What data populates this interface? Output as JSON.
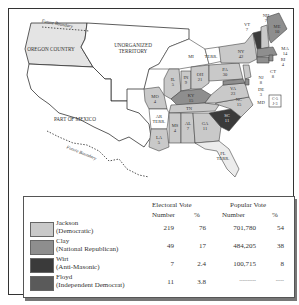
{
  "map": {
    "regions": {
      "oregon": "OREGON COUNTRY",
      "unorganized_1": "UNORGANIZED",
      "unorganized_2": "TERRITORY",
      "mexico": "PART OF MEXICO",
      "future_boundary_north": "Future Boundary",
      "future_boundary_south": "Future Boundary"
    },
    "states": [
      {
        "abbr": "MI",
        "votes": ""
      },
      {
        "abbr": "TERR.",
        "votes": ""
      },
      {
        "abbr": "IL",
        "votes": "5"
      },
      {
        "abbr": "IN",
        "votes": "9"
      },
      {
        "abbr": "OH",
        "votes": "21"
      },
      {
        "abbr": "MO",
        "votes": "4"
      },
      {
        "abbr": "KY",
        "votes": "15"
      },
      {
        "abbr": "TN",
        "votes": "15"
      },
      {
        "abbr": "AR",
        "votes": "TERR."
      },
      {
        "abbr": "MS",
        "votes": "4"
      },
      {
        "abbr": "AL",
        "votes": "7"
      },
      {
        "abbr": "GA",
        "votes": "11"
      },
      {
        "abbr": "LA",
        "votes": "5"
      },
      {
        "abbr": "FL",
        "votes": "TERR."
      },
      {
        "abbr": "SC",
        "votes": "11"
      },
      {
        "abbr": "NC",
        "votes": "15"
      },
      {
        "abbr": "VA",
        "votes": "23"
      },
      {
        "abbr": "PA",
        "votes": "30"
      },
      {
        "abbr": "NY",
        "votes": "42"
      },
      {
        "abbr": "VT",
        "votes": "7"
      },
      {
        "abbr": "NH",
        "votes": "7"
      },
      {
        "abbr": "ME",
        "votes": "10"
      },
      {
        "abbr": "MA",
        "votes": "14"
      },
      {
        "abbr": "RI",
        "votes": "4"
      },
      {
        "abbr": "CT",
        "votes": "8"
      },
      {
        "abbr": "NJ",
        "votes": "8"
      },
      {
        "abbr": "DE",
        "votes": "3"
      },
      {
        "abbr": "MD",
        "votes": ""
      }
    ],
    "md_split": {
      "line1": "C-5",
      "line2": "J-3"
    }
  },
  "legend": {
    "headers": {
      "electoral": "Electoral Vote",
      "popular": "Popular Vote",
      "number": "Number",
      "percent": "%"
    },
    "rows": [
      {
        "name": "Jackson",
        "party": "(Democratic)",
        "ev_num": "219",
        "ev_pct": "76",
        "pv_num": "701,780",
        "pv_pct": "54",
        "color": "#c9c9c9"
      },
      {
        "name": "Clay",
        "party": "(National Republican)",
        "ev_num": "49",
        "ev_pct": "17",
        "pv_num": "484,205",
        "pv_pct": "38",
        "color": "#8e8e8e"
      },
      {
        "name": "Wirt",
        "party": "(Anti-Masonic)",
        "ev_num": "7",
        "ev_pct": "2.4",
        "pv_num": "100,715",
        "pv_pct": "8",
        "color": "#3a3a3a"
      },
      {
        "name": "Floyd",
        "party": "(Independent Democrat)",
        "ev_num": "11",
        "ev_pct": "3.8",
        "pv_num": "----------",
        "pv_pct": "-----",
        "color": "#5a5a5a"
      }
    ]
  }
}
